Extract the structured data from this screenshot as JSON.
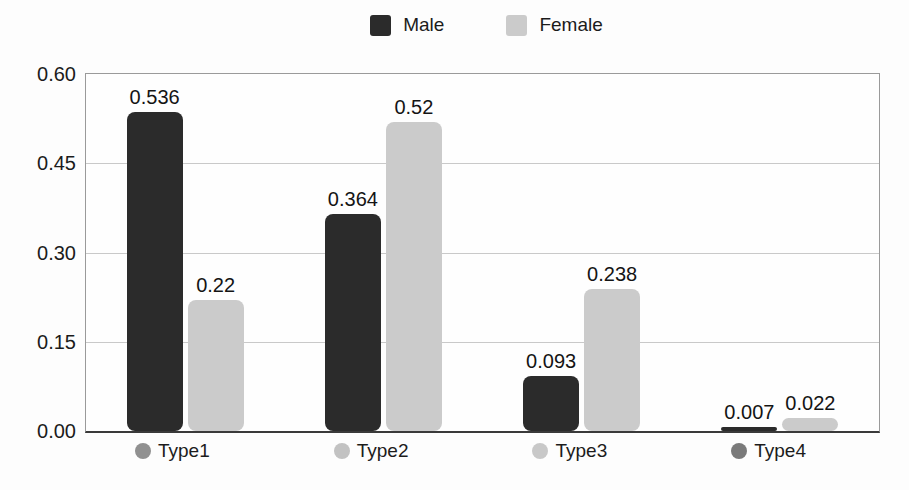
{
  "chart_data": {
    "type": "bar",
    "title": "",
    "xlabel": "",
    "ylabel": "",
    "categories": [
      "Type1",
      "Type2",
      "Type3",
      "Type4"
    ],
    "category_dot_colors": [
      "#909090",
      "#c2c2c2",
      "#c8c8c8",
      "#7a7a7a"
    ],
    "series": [
      {
        "name": "Male",
        "color": "#2b2b2b",
        "values": [
          0.536,
          0.364,
          0.093,
          0.007
        ]
      },
      {
        "name": "Female",
        "color": "#cbcbcb",
        "values": [
          0.22,
          0.52,
          0.238,
          0.022
        ]
      }
    ],
    "value_labels": {
      "male": [
        "0.536",
        "0.364",
        "0.093",
        "0.007"
      ],
      "female": [
        "0.22",
        "0.52",
        "0.238",
        "0.022"
      ]
    },
    "ylim": [
      0,
      0.6
    ],
    "ytick_labels": [
      "0.60",
      "0.45",
      "0.30",
      "0.15",
      "0.00"
    ],
    "grid": true,
    "legend_position": "top"
  }
}
